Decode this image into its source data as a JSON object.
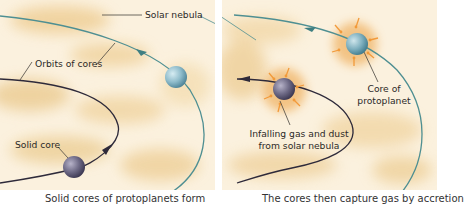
{
  "panels": [
    {
      "id": "left",
      "labels": {
        "solar_nebula": "Solar nebula",
        "orbits": "Orbits of cores",
        "solid_core": "Solid core"
      },
      "caption": "Solid cores of protoplanets form"
    },
    {
      "id": "right",
      "labels": {
        "core": [
          "Core of",
          "protoplanet"
        ],
        "infalling": [
          "Infalling gas and dust",
          "from solar nebula"
        ]
      },
      "caption": "The cores then capture gas by accretion"
    }
  ],
  "colors": {
    "nebula_light": "#fbf1de",
    "nebula_dark": "#eecf98",
    "outer_orbit": "#4e8f92",
    "inner_orbit": "#2e2a3a",
    "outer_core": "#8fbccb",
    "inner_core": "#6e6a86",
    "infall_arrows": "#f29a3a"
  }
}
